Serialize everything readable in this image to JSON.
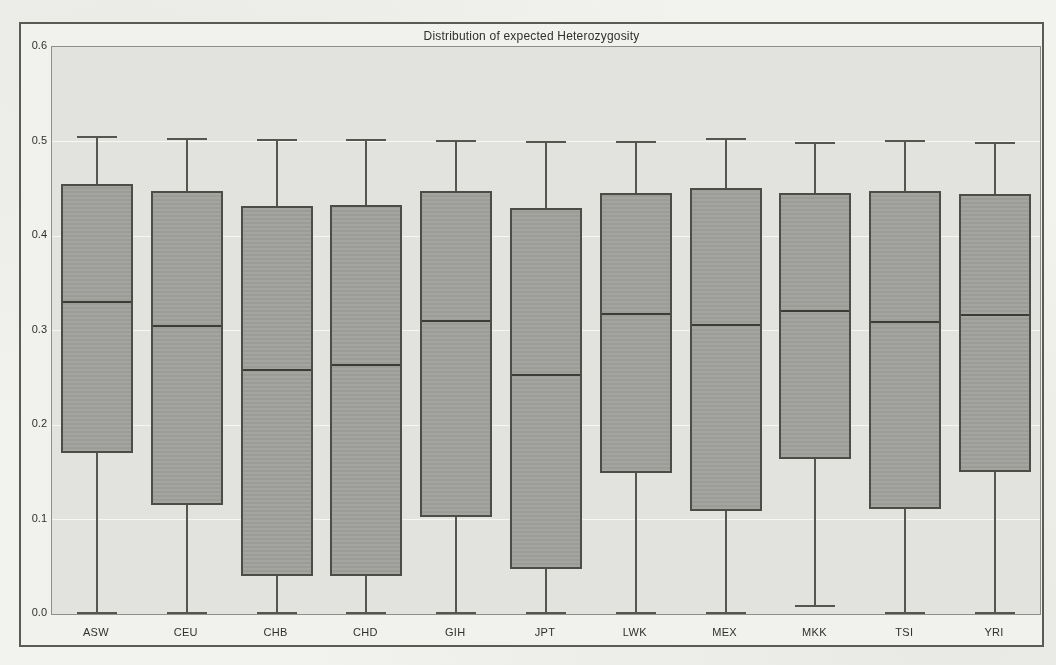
{
  "chart_data": {
    "type": "boxplot",
    "title": "Distribution of expected Heterozygosity",
    "xlabel": "",
    "ylabel": "",
    "ylim": [
      0.0,
      0.6
    ],
    "ytick_values": [
      0.0,
      0.1,
      0.2,
      0.3,
      0.4,
      0.5,
      0.6
    ],
    "ytick_labels": [
      "0.0",
      "0.1",
      "0.2",
      "0.3",
      "0.4",
      "0.5",
      "0.6"
    ],
    "grid": "horizontal white gridlines on light gray plot background",
    "legend": "none",
    "box_width_fraction": 0.8,
    "categories": [
      "ASW",
      "CEU",
      "CHB",
      "CHD",
      "GIH",
      "JPT",
      "LWK",
      "MEX",
      "MKK",
      "TSI",
      "YRI"
    ],
    "series": [
      {
        "label": "ASW",
        "whisker_low": 0.0,
        "q1": 0.17,
        "median": 0.33,
        "q3": 0.455,
        "whisker_high": 0.505
      },
      {
        "label": "CEU",
        "whisker_low": 0.0,
        "q1": 0.115,
        "median": 0.305,
        "q3": 0.448,
        "whisker_high": 0.503
      },
      {
        "label": "CHB",
        "whisker_low": 0.0,
        "q1": 0.04,
        "median": 0.258,
        "q3": 0.432,
        "whisker_high": 0.502
      },
      {
        "label": "CHD",
        "whisker_low": 0.0,
        "q1": 0.04,
        "median": 0.263,
        "q3": 0.433,
        "whisker_high": 0.502
      },
      {
        "label": "GIH",
        "whisker_low": 0.0,
        "q1": 0.103,
        "median": 0.31,
        "q3": 0.448,
        "whisker_high": 0.501
      },
      {
        "label": "JPT",
        "whisker_low": 0.0,
        "q1": 0.048,
        "median": 0.253,
        "q3": 0.43,
        "whisker_high": 0.5
      },
      {
        "label": "LWK",
        "whisker_low": 0.0,
        "q1": 0.149,
        "median": 0.317,
        "q3": 0.445,
        "whisker_high": 0.5
      },
      {
        "label": "MEX",
        "whisker_low": 0.0,
        "q1": 0.109,
        "median": 0.306,
        "q3": 0.451,
        "whisker_high": 0.503
      },
      {
        "label": "MKK",
        "whisker_low": 0.008,
        "q1": 0.164,
        "median": 0.321,
        "q3": 0.446,
        "whisker_high": 0.498
      },
      {
        "label": "TSI",
        "whisker_low": 0.0,
        "q1": 0.111,
        "median": 0.309,
        "q3": 0.448,
        "whisker_high": 0.501
      },
      {
        "label": "YRI",
        "whisker_low": 0.0,
        "q1": 0.15,
        "median": 0.316,
        "q3": 0.444,
        "whisker_high": 0.498
      }
    ],
    "colors": {
      "page_bg": "#f4f4f1",
      "figure_bg": "#f3f3f0",
      "frame": "#3e3e38",
      "plot_bg": "#e4e4e1",
      "gridline": "#fafaf8",
      "box_fill": "#a1a19d",
      "box_border": "#4c4c46",
      "median": "#3b3b36",
      "text": "#2e2e2a"
    }
  }
}
